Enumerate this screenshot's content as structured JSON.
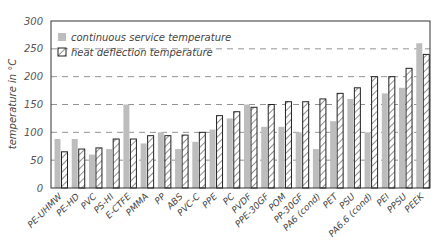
{
  "chart_data": {
    "type": "bar",
    "title": "",
    "xlabel": "",
    "ylabel": "temperature in °C",
    "ylim": [
      0,
      300
    ],
    "yticks": [
      0,
      50,
      100,
      150,
      200,
      250,
      300
    ],
    "grid": "horizontal dashed",
    "legend_position": "upper left, inside",
    "categories": [
      "PE-UHMW",
      "PE-HD",
      "PVC",
      "PS-HI",
      "E-CTFE",
      "PMMA",
      "PP",
      "ABS",
      "PVC-C",
      "PPE",
      "PC",
      "PVDF",
      "PPE-30GF",
      "POM",
      "PP-30GF",
      "PA6 (cond)",
      "PET",
      "PSU",
      "PA6.6 (cond)",
      "PEI",
      "PPSU",
      "PEEK"
    ],
    "series": [
      {
        "name": "continuous service temperature",
        "style": "solid gray",
        "color": "#bdbdbd",
        "values": [
          88,
          88,
          60,
          70,
          150,
          80,
          100,
          70,
          83,
          105,
          125,
          150,
          110,
          110,
          100,
          70,
          120,
          160,
          100,
          170,
          180,
          260
        ]
      },
      {
        "name": "heat deflection temperature",
        "style": "hatched",
        "color": "#222222",
        "values": [
          65,
          70,
          72,
          88,
          88,
          94,
          94,
          95,
          100,
          130,
          137,
          145,
          150,
          155,
          155,
          160,
          170,
          180,
          200,
          200,
          215,
          240
        ]
      }
    ]
  },
  "legend": {
    "items": [
      {
        "label": "continuous service temperature"
      },
      {
        "label": "heat deflection temperature"
      }
    ]
  }
}
